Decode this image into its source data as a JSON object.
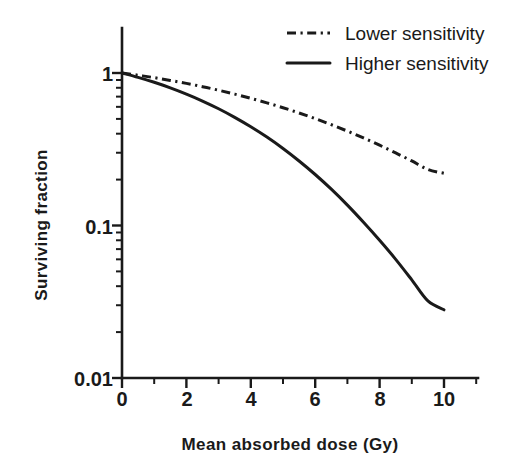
{
  "chart_data": {
    "type": "line",
    "title": "",
    "subtitle": "",
    "xlabel": "Mean absorbed dose (Gy)",
    "ylabel": "Surviving fraction",
    "xscale": "linear",
    "yscale": "log",
    "xlim": [
      0,
      11
    ],
    "ylim": [
      0.01,
      1
    ],
    "grid": false,
    "legend_position": "top-right",
    "x_ticks_major": [
      0,
      2,
      4,
      6,
      8,
      10
    ],
    "x_tick_labels": [
      "0",
      "2",
      "4",
      "6",
      "8",
      "10"
    ],
    "x_ticks_minor": [
      1,
      3,
      5,
      7,
      9,
      11
    ],
    "y_ticks_major": [
      1,
      0.1,
      0.01
    ],
    "y_tick_labels": [
      "1",
      "0.1",
      "0.01"
    ],
    "x": [
      0,
      0.5,
      1,
      1.5,
      2,
      2.5,
      3,
      3.5,
      4,
      4.5,
      5,
      5.5,
      6,
      6.5,
      7,
      7.5,
      8,
      8.5,
      9,
      9.5,
      10
    ],
    "series": [
      {
        "name": "Lower sensitivity",
        "linestyle": "dashdot",
        "color": "#1a1a1a",
        "values": [
          1.0,
          0.967,
          0.932,
          0.894,
          0.855,
          0.813,
          0.771,
          0.727,
          0.682,
          0.637,
          0.592,
          0.547,
          0.502,
          0.458,
          0.416,
          0.375,
          0.336,
          0.299,
          0.265,
          0.233,
          0.22
        ]
      },
      {
        "name": "Higher sensitivity",
        "linestyle": "solid",
        "color": "#1a1a1a",
        "values": [
          1.0,
          0.936,
          0.869,
          0.799,
          0.727,
          0.655,
          0.583,
          0.512,
          0.444,
          0.38,
          0.32,
          0.265,
          0.216,
          0.173,
          0.136,
          0.105,
          0.08,
          0.06,
          0.044,
          0.032,
          0.028
        ]
      }
    ]
  },
  "axes": {
    "y_label": "Surviving fraction",
    "x_label": "Mean absorbed dose (Gy)",
    "y_tick_1": "1",
    "y_tick_01": "0.1",
    "y_tick_001": "0.01",
    "x_tick_0": "0",
    "x_tick_2": "2",
    "x_tick_4": "4",
    "x_tick_6": "6",
    "x_tick_8": "8",
    "x_tick_10": "10"
  },
  "legend": {
    "items": [
      {
        "label": "Lower sensitivity",
        "style": "dash-dot"
      },
      {
        "label": "Higher sensitivity",
        "style": "solid"
      }
    ]
  },
  "colors": {
    "ink": "#1a1a1a",
    "background": "#ffffff"
  }
}
